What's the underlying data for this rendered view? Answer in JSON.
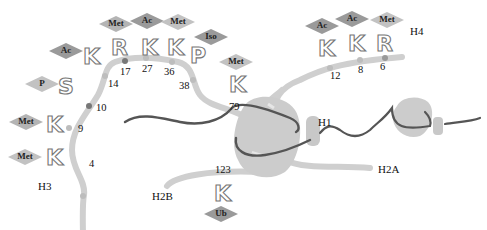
{
  "histones": {
    "h3": "H3",
    "h4": "H4",
    "h1": "H1",
    "h2a": "H2A",
    "h2b": "H2B"
  },
  "colors": {
    "tail": "#cfcfcf",
    "dna": "#555555",
    "core": "#cccccc",
    "mod_dark": "#9a9a9a",
    "mod_light": "#c2c2c2",
    "site_dot": "#777777"
  },
  "h3_tail": {
    "residues": [
      {
        "letter": "K",
        "pos": "4",
        "mod": "Met"
      },
      {
        "letter": "K",
        "pos": "9",
        "mod": "Met"
      },
      {
        "letter": "S",
        "pos": "10",
        "mod": "P"
      },
      {
        "letter": "K",
        "pos": "14",
        "mod": "Ac"
      },
      {
        "letter": "R",
        "pos": "17",
        "mod": "Met"
      },
      {
        "letter": "K",
        "pos": "27",
        "mod": "Ac"
      },
      {
        "letter": "K",
        "pos": "36",
        "mod": "Met"
      },
      {
        "letter": "P",
        "pos": "38",
        "mod": "Iso"
      },
      {
        "letter": "K",
        "pos": "79",
        "mod": "Met"
      }
    ]
  },
  "h4_tail": {
    "residues": [
      {
        "letter": "K",
        "pos": "12",
        "mod": "Ac"
      },
      {
        "letter": "K",
        "pos": "8",
        "mod": "Ac"
      },
      {
        "letter": "R",
        "pos": "6",
        "mod": "Met"
      }
    ]
  },
  "h2b_tail": {
    "residues": [
      {
        "letter": "K",
        "pos": "123",
        "mod": "Ub"
      }
    ]
  }
}
